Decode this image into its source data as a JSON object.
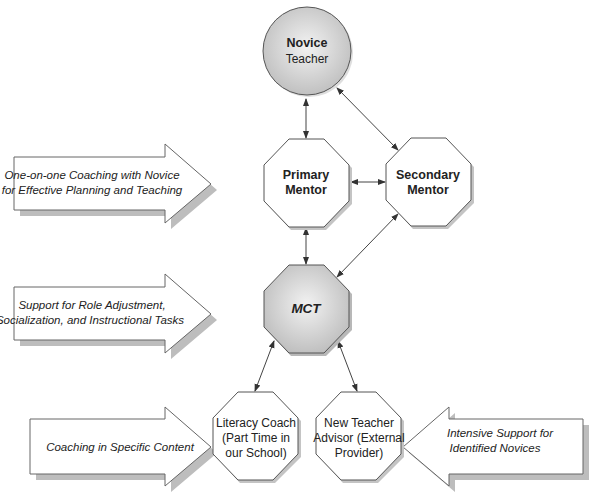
{
  "diagram": {
    "type": "mentoring-support-structure",
    "nodes": {
      "novice": {
        "line1": "Novice",
        "line2": "Teacher",
        "shape": "circle",
        "fill": "#cfcfcf"
      },
      "primary": {
        "line1": "Primary",
        "line2": "Mentor",
        "shape": "octagon",
        "fill": "#ffffff"
      },
      "secondary": {
        "line1": "Secondary",
        "line2": "Mentor",
        "shape": "octagon",
        "fill": "#ffffff"
      },
      "mct": {
        "line1": "MCT",
        "shape": "octagon",
        "fill": "#cfcfcf"
      },
      "literacy": {
        "line1": "Literacy Coach",
        "line2": "(Part Time in",
        "line3": "our School)",
        "shape": "octagon",
        "fill": "#ffffff"
      },
      "advisor": {
        "line1": "New Teacher",
        "line2": "Advisor (External",
        "line3": "Provider)",
        "shape": "octagon",
        "fill": "#ffffff"
      }
    },
    "labels": {
      "one_on_one": {
        "line1": "One-on-one Coaching with Novice",
        "line2": "for Effective Planning and Teaching",
        "direction": "right",
        "points_to": "primary"
      },
      "role_support": {
        "line1": "Support for Role Adjustment,",
        "line2": "Socialization, and Instructional Tasks",
        "direction": "right",
        "points_to": "mct"
      },
      "content": {
        "line1": "Coaching in Specific Content",
        "direction": "right",
        "points_to": "literacy"
      },
      "intensive": {
        "line1": "Intensive Support  for",
        "line2": "Identified Novices",
        "direction": "left",
        "points_to": "advisor"
      }
    },
    "edges": [
      {
        "from": "novice",
        "to": "primary",
        "bidirectional": true
      },
      {
        "from": "novice",
        "to": "secondary",
        "bidirectional": true
      },
      {
        "from": "primary",
        "to": "secondary",
        "bidirectional": true
      },
      {
        "from": "primary",
        "to": "mct",
        "bidirectional": true
      },
      {
        "from": "secondary",
        "to": "mct",
        "bidirectional": true
      },
      {
        "from": "mct",
        "to": "literacy",
        "bidirectional": true
      },
      {
        "from": "mct",
        "to": "advisor",
        "bidirectional": true
      }
    ],
    "colors": {
      "stroke": "#555555",
      "shadow": "#bdbdbd",
      "gray_fill": "#cfcfcf",
      "text": "#222222"
    }
  }
}
